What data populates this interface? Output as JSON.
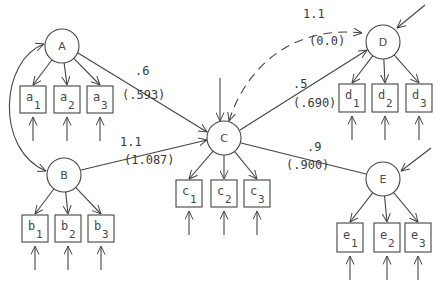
{
  "diagram": {
    "type": "path-diagram",
    "latents": [
      {
        "id": "A",
        "label": "A",
        "cx": 62,
        "cy": 46,
        "r": 17
      },
      {
        "id": "B",
        "label": "B",
        "cx": 64,
        "cy": 175,
        "r": 17
      },
      {
        "id": "C",
        "label": "C",
        "cx": 224,
        "cy": 138,
        "r": 17
      },
      {
        "id": "D",
        "label": "D",
        "cx": 383,
        "cy": 42,
        "r": 17
      },
      {
        "id": "E",
        "label": "E",
        "cx": 383,
        "cy": 179,
        "r": 17
      }
    ],
    "indicators": {
      "A": [
        {
          "base": "a",
          "sub": "1",
          "x": 20
        },
        {
          "base": "a",
          "sub": "2",
          "x": 54
        },
        {
          "base": "a",
          "sub": "3",
          "x": 87
        }
      ],
      "B": [
        {
          "base": "b",
          "sub": "1",
          "x": 22
        },
        {
          "base": "b",
          "sub": "2",
          "x": 55
        },
        {
          "base": "b",
          "sub": "3",
          "x": 88
        }
      ],
      "C": [
        {
          "base": "c",
          "sub": "1",
          "x": 176
        },
        {
          "base": "c",
          "sub": "2",
          "x": 211
        },
        {
          "base": "c",
          "sub": "3",
          "x": 244
        }
      ],
      "D": [
        {
          "base": "d",
          "sub": "1",
          "x": 339
        },
        {
          "base": "d",
          "sub": "2",
          "x": 372
        },
        {
          "base": "d",
          "sub": "3",
          "x": 406
        }
      ],
      "E": [
        {
          "base": "e",
          "sub": "1",
          "x": 337
        },
        {
          "base": "e",
          "sub": "2",
          "x": 374
        },
        {
          "base": "e",
          "sub": "3",
          "x": 405
        }
      ]
    },
    "indicator_rows": {
      "A": {
        "y": 86,
        "h": 27
      },
      "B": {
        "y": 215,
        "h": 27
      },
      "C": {
        "y": 180,
        "h": 27
      },
      "D": {
        "y": 84,
        "h": 28
      },
      "E": {
        "y": 223,
        "h": 29
      }
    },
    "paths": [
      {
        "from": "A",
        "to": "C",
        "coef": ".6",
        "estimate": "(.593)"
      },
      {
        "from": "B",
        "to": "C",
        "coef": "1.1",
        "estimate": "(1.087)"
      },
      {
        "from": "C",
        "to": "D",
        "coef": ".5",
        "estimate": "(.690)"
      },
      {
        "from": "C",
        "to": "E",
        "coef": ".9",
        "estimate": "(.900)"
      },
      {
        "from": "C",
        "to": "D",
        "style": "dashed",
        "bidirectional": true,
        "coef": "1.1",
        "estimate": "(0.0)"
      },
      {
        "from": "A",
        "to": "B",
        "style": "curved",
        "bidirectional": true
      }
    ],
    "labels": {
      "ac_coef": ".6",
      "ac_est": "(.593)",
      "bc_coef": "1.1",
      "bc_est": "(1.087)",
      "cd_coef": ".5",
      "cd_est": "(.690)",
      "ce_coef": ".9",
      "ce_est": "(.900)",
      "dashed_coef": "1.1",
      "dashed_est": "(0.0)"
    },
    "node_labels": {
      "A": "A",
      "B": "B",
      "C": "C",
      "D": "D",
      "E": "E"
    },
    "indicator_labels": {
      "a1": {
        "base": "a",
        "sub": "1"
      },
      "a2": {
        "base": "a",
        "sub": "2"
      },
      "a3": {
        "base": "a",
        "sub": "3"
      },
      "b1": {
        "base": "b",
        "sub": "1"
      },
      "b2": {
        "base": "b",
        "sub": "2"
      },
      "b3": {
        "base": "b",
        "sub": "3"
      },
      "c1": {
        "base": "c",
        "sub": "1"
      },
      "c2": {
        "base": "c",
        "sub": "2"
      },
      "c3": {
        "base": "c",
        "sub": "3"
      },
      "d1": {
        "base": "d",
        "sub": "1"
      },
      "d2": {
        "base": "d",
        "sub": "2"
      },
      "d3": {
        "base": "d",
        "sub": "3"
      },
      "e1": {
        "base": "e",
        "sub": "1"
      },
      "e2": {
        "base": "e",
        "sub": "2"
      },
      "e3": {
        "base": "e",
        "sub": "3"
      }
    }
  }
}
